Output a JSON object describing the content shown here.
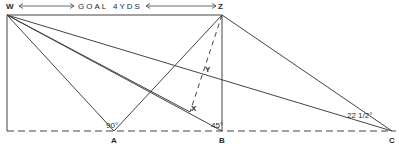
{
  "header": {
    "left_point": "W",
    "right_point": "Z",
    "label_goal": "GOAL",
    "label_width": "4YDS"
  },
  "points": {
    "W": "W",
    "Z": "Z",
    "A": "A",
    "B": "B",
    "C": "C",
    "X": "X",
    "Y": "Y"
  },
  "angles": {
    "A": "90°",
    "B": "45°",
    "C": "22 1/2°"
  },
  "colors": {
    "line": "#444444",
    "text": "#2a2a2a",
    "background": "#ffffff"
  }
}
